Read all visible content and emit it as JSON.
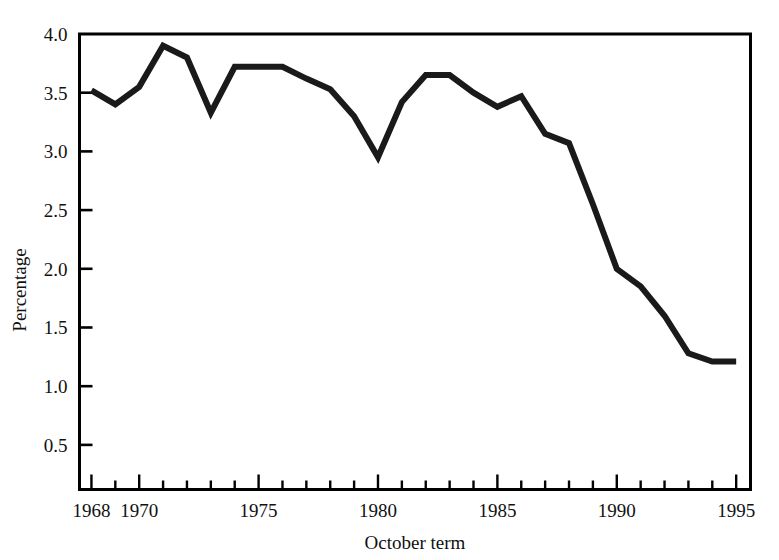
{
  "chart_data": {
    "type": "line",
    "title": "",
    "subtitle": "",
    "xlabel": "October term",
    "ylabel": "Percentage",
    "grid": false,
    "legend": null,
    "legend_position": "none",
    "line_color": "#1a1a1a",
    "background_color": "#ffffff",
    "axis_color": "#000000",
    "xlim": [
      1967.5,
      1995.6
    ],
    "ylim": [
      0.12,
      4.0
    ],
    "x_tick_labels": [
      "1968",
      "1970",
      "1975",
      "1980",
      "1985",
      "1990",
      "1995"
    ],
    "x_tick_values": [
      1968,
      1970,
      1975,
      1980,
      1985,
      1990,
      1995
    ],
    "x_minor_tick_values": [
      1968,
      1969,
      1970,
      1971,
      1972,
      1973,
      1974,
      1975,
      1976,
      1977,
      1978,
      1979,
      1980,
      1981,
      1982,
      1983,
      1984,
      1985,
      1986,
      1987,
      1988,
      1989,
      1990,
      1991,
      1992,
      1993,
      1994,
      1995
    ],
    "y_tick_labels": [
      "0.5",
      "1.0",
      "1.5",
      "2.0",
      "2.5",
      "3.0",
      "3.5",
      "4.0"
    ],
    "y_tick_values": [
      0.5,
      1.0,
      1.5,
      2.0,
      2.5,
      3.0,
      3.5,
      4.0
    ],
    "x": [
      1968,
      1969,
      1970,
      1971,
      1972,
      1973,
      1974,
      1975,
      1976,
      1977,
      1978,
      1979,
      1980,
      1981,
      1982,
      1983,
      1984,
      1985,
      1986,
      1987,
      1988,
      1989,
      1990,
      1991,
      1992,
      1993,
      1994,
      1995
    ],
    "values": [
      3.52,
      3.4,
      3.55,
      3.9,
      3.8,
      3.33,
      3.72,
      3.72,
      3.72,
      3.62,
      3.53,
      3.3,
      2.95,
      3.42,
      3.65,
      3.65,
      3.5,
      3.38,
      3.47,
      3.15,
      3.07,
      2.55,
      2.0,
      1.85,
      1.6,
      1.28,
      1.21,
      1.21
    ],
    "series": [
      {
        "name": "Percentage",
        "values": [
          3.52,
          3.4,
          3.55,
          3.9,
          3.8,
          3.33,
          3.72,
          3.72,
          3.72,
          3.62,
          3.53,
          3.3,
          2.95,
          3.42,
          3.65,
          3.65,
          3.5,
          3.38,
          3.47,
          3.15,
          3.07,
          2.55,
          2.0,
          1.85,
          1.6,
          1.28,
          1.21,
          1.21
        ]
      }
    ]
  },
  "axes": {
    "x_title": "October term",
    "y_title": "Percentage"
  }
}
